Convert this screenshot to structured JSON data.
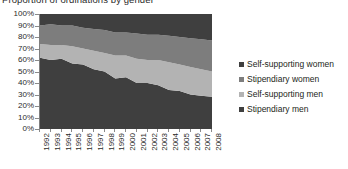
{
  "chart_data": {
    "type": "area",
    "stacked": "100%",
    "title": "Proportion of ordinations by gender",
    "xlabel": "",
    "ylabel": "",
    "ylim": [
      0,
      100
    ],
    "ytick_labels": [
      "100%",
      "90%",
      "80%",
      "70%",
      "60%",
      "50%",
      "40%",
      "30%",
      "20%",
      "10%",
      "0%"
    ],
    "ytick_values": [
      100,
      90,
      80,
      70,
      60,
      50,
      40,
      30,
      20,
      10,
      0
    ],
    "grid": false,
    "legend_position": "right",
    "categories": [
      "1992",
      "1993",
      "1994",
      "1995",
      "1996",
      "1997",
      "1998",
      "1999",
      "2000",
      "2001",
      "2002",
      "2003",
      "2004",
      "2005",
      "2006",
      "2007",
      "2008"
    ],
    "series": [
      {
        "name": "Stipendiary men",
        "color": "#3f3f3f",
        "stack_order": 1,
        "values": [
          62,
          60,
          61,
          57,
          56,
          52,
          50,
          44,
          45,
          40,
          40,
          38,
          34,
          33,
          30,
          29,
          28
        ]
      },
      {
        "name": "Self-supporting men",
        "color": "#b3b3b3",
        "stack_order": 2,
        "values": [
          12,
          13,
          12,
          15,
          14,
          16,
          16,
          20,
          19,
          21,
          20,
          22,
          24,
          23,
          24,
          23,
          22
        ]
      },
      {
        "name": "Stipendiary women",
        "color": "#7d7d7d",
        "stack_order": 3,
        "values": [
          16,
          18,
          17,
          18,
          18,
          19,
          20,
          20,
          20,
          22,
          22,
          22,
          23,
          24,
          25,
          26,
          27
        ]
      },
      {
        "name": "Self-supporting women",
        "color": "#3f3f3f",
        "stack_order": 4,
        "values": [
          10,
          9,
          10,
          10,
          12,
          13,
          14,
          16,
          16,
          17,
          18,
          18,
          19,
          20,
          21,
          22,
          23
        ]
      }
    ],
    "legend": [
      {
        "label": "Self-supporting women",
        "color": "#3f3f3f"
      },
      {
        "label": "Stipendiary women",
        "color": "#7d7d7d"
      },
      {
        "label": "Self-supporting men",
        "color": "#b3b3b3"
      },
      {
        "label": "Stipendiary men",
        "color": "#3f3f3f"
      }
    ],
    "colors": {
      "dark_gray": "#3f3f3f",
      "medium_gray": "#7d7d7d",
      "light_gray": "#b3b3b3",
      "axis": "#7f7f7f",
      "text": "#231f20",
      "background": "#ffffff"
    }
  }
}
